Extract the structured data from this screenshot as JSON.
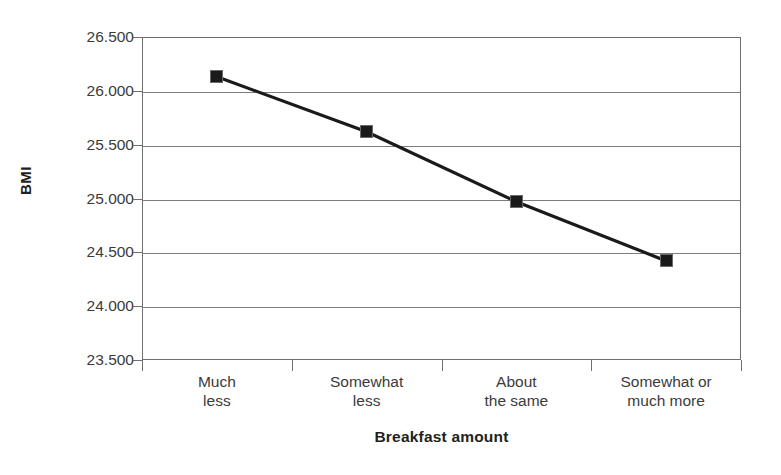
{
  "chart_data": {
    "type": "line",
    "title": "",
    "subtitle": "",
    "xlabel": "Breakfast amount",
    "ylabel": "BMI",
    "categories": [
      "Much less",
      "Somewhat less",
      "About the same",
      "Somewhat or much more"
    ],
    "category_lines": [
      [
        "Much",
        "less"
      ],
      [
        "Somewhat",
        "less"
      ],
      [
        "About",
        "the same"
      ],
      [
        "Somewhat or",
        "much more"
      ]
    ],
    "values": [
      26.13,
      25.62,
      24.97,
      24.42
    ],
    "series": [
      {
        "name": "BMI",
        "values": [
          26.13,
          25.62,
          24.97,
          24.42
        ]
      }
    ],
    "ylim": [
      23.5,
      26.5
    ],
    "ytick_values": [
      26.5,
      26.0,
      25.5,
      25.0,
      24.5,
      24.0,
      23.5
    ],
    "ytick_labels": [
      "26.500",
      "26.000",
      "25.500",
      "25.000",
      "24.500",
      "24.000",
      "23.500"
    ],
    "grid": true,
    "grid_axis": "y",
    "legend_position": "none",
    "marker": "square",
    "marker_color": "#1a1a1a",
    "line_color": "#1a1a1a",
    "grid_color": "#7d7d7d",
    "frame_color": "#6f6f6f",
    "background": "#ffffff",
    "annotations": []
  }
}
